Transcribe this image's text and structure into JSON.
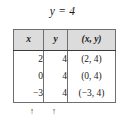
{
  "figure": {
    "equation_title": "y = 4",
    "table": {
      "headers": [
        "x",
        "y",
        "(x, y)"
      ],
      "rows": [
        {
          "x": "2",
          "y": "4",
          "xy": "(2, 4)"
        },
        {
          "x": "0",
          "y": "4",
          "xy": "(0, 4)"
        },
        {
          "x": "−3",
          "y": "4",
          "xy": "(−3, 4)"
        }
      ]
    },
    "markers": {
      "x_arrow": "↑",
      "y_arrow": "↑"
    },
    "colors": {
      "header_background": "#dcdcdc",
      "border": "#6e6e6e",
      "header_rule": "#3a3a3a",
      "text": "#1a1a1a",
      "page_background": "#ffffff"
    }
  }
}
